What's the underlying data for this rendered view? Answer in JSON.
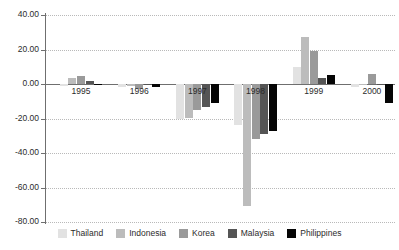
{
  "chart_data": {
    "type": "bar",
    "title": "",
    "subtitle": "",
    "xlabel": "",
    "ylabel": "",
    "categories": [
      "1995",
      "1996",
      "1997",
      "1998",
      "1999",
      "2000"
    ],
    "series": [
      {
        "name": "Thailand",
        "color": "#e2e2e2",
        "values": [
          -1.0,
          -1.5,
          -20.0,
          -24.0,
          10.0,
          -2.0
        ]
      },
      {
        "name": "Indonesia",
        "color": "#bcbcbc",
        "values": [
          3.5,
          -1.0,
          -19.5,
          -70.5,
          27.5,
          -0.3
        ]
      },
      {
        "name": "Korea",
        "color": "#9a9a9a",
        "values": [
          4.5,
          -3.0,
          -15.0,
          -32.0,
          19.0,
          6.0
        ]
      },
      {
        "name": "Malaysia",
        "color": "#555555",
        "values": [
          2.0,
          -0.5,
          -13.5,
          -29.0,
          3.5,
          -0.3
        ]
      },
      {
        "name": "Philippines",
        "color": "#050505",
        "values": [
          0.2,
          -2.0,
          -11.0,
          -27.5,
          5.0,
          -11.0
        ]
      }
    ],
    "ylim": [
      -80,
      40
    ],
    "ytick_values": [
      40,
      20,
      0,
      -20,
      -40,
      -60,
      -80
    ],
    "ytick_labels": [
      "40.00",
      "20.00",
      "0.00",
      "-20.00",
      "-40.00",
      "-60.00",
      "-80.00"
    ],
    "grid": true,
    "grid_axis": "y",
    "legend_position": "bottom",
    "zero_line": true
  },
  "legend": {
    "entries": [
      {
        "label": "Thailand"
      },
      {
        "label": "Indonesia"
      },
      {
        "label": "Korea"
      },
      {
        "label": "Malaysia"
      },
      {
        "label": "Philippines"
      }
    ]
  }
}
